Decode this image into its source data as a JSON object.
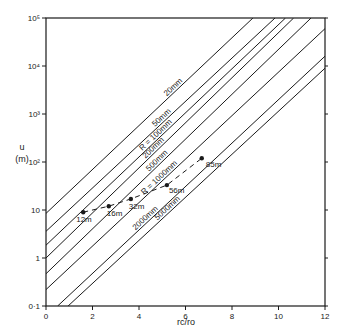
{
  "chart_data": {
    "type": "line",
    "title": "",
    "xlabel": "rc/ro",
    "ylabel": "u (m)",
    "xlim": [
      0,
      12
    ],
    "ylim": [
      0.1,
      100000
    ],
    "yscale": "log",
    "grid": false,
    "x_ticks": [
      "0",
      "2",
      "4",
      "6",
      "8",
      "10",
      "12"
    ],
    "y_ticks": [
      "0·1",
      "1",
      "10",
      "10²",
      "10³",
      "10⁴",
      "10⁵"
    ],
    "series": [
      {
        "name": "20 mm",
        "label": "20mm",
        "points": [
          [
            0,
            8.5
          ],
          [
            8.9,
            100000
          ]
        ]
      },
      {
        "name": "50 mm",
        "label": "50mm",
        "points": [
          [
            0,
            3.6
          ],
          [
            9.85,
            100000
          ]
        ]
      },
      {
        "name": "R = 100 mm",
        "label": "R = 100mm",
        "points": [
          [
            0,
            1.85
          ],
          [
            10.3,
            100000
          ]
        ]
      },
      {
        "name": "200 mm",
        "label": "200mm",
        "points": [
          [
            0,
            1.0
          ],
          [
            10.65,
            100000
          ]
        ]
      },
      {
        "name": "500 mm",
        "label": "500mm",
        "points": [
          [
            0,
            0.47
          ],
          [
            11.4,
            100000
          ]
        ]
      },
      {
        "name": "R = 1000 mm",
        "label": "R = 1000mm",
        "points": [
          [
            0,
            0.22
          ],
          [
            12,
            60000
          ]
        ]
      },
      {
        "name": "2000 mm",
        "label": "2000mm",
        "points": [
          [
            0.5,
            0.1
          ],
          [
            12,
            16000
          ]
        ]
      },
      {
        "name": "5000 mm",
        "label": "5000mm",
        "points": [
          [
            0.95,
            0.1
          ],
          [
            12,
            9000
          ]
        ]
      }
    ],
    "observed": {
      "name": "measured points",
      "style": "dashed",
      "points": [
        {
          "x": 1.6,
          "y": 9,
          "label": "12m"
        },
        {
          "x": 2.7,
          "y": 12,
          "label": "16m"
        },
        {
          "x": 3.65,
          "y": 17,
          "label": "32m"
        },
        {
          "x": 5.2,
          "y": 33,
          "label": "56m"
        },
        {
          "x": 6.7,
          "y": 120,
          "label": "85m"
        }
      ]
    }
  },
  "axes": {
    "x_title": "rc/ro",
    "y_title_top": "u",
    "y_title_bottom": "(m)"
  },
  "colors": {
    "ink": "#1a1a1a",
    "background": "#ffffff"
  }
}
